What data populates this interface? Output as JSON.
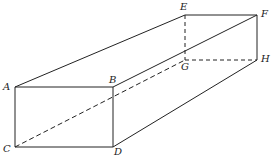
{
  "diagram": {
    "type": "rectangular prism (box) in perspective",
    "vertices": {
      "A": {
        "label": "A",
        "x": 15,
        "y": 87
      },
      "B": {
        "label": "B",
        "x": 113,
        "y": 87
      },
      "C": {
        "label": "C",
        "x": 15,
        "y": 147
      },
      "D": {
        "label": "D",
        "x": 113,
        "y": 147
      },
      "E": {
        "label": "E",
        "x": 185,
        "y": 15
      },
      "F": {
        "label": "F",
        "x": 257,
        "y": 15
      },
      "G": {
        "label": "G",
        "x": 185,
        "y": 60
      },
      "H": {
        "label": "H",
        "x": 257,
        "y": 60
      }
    },
    "solid_edges": [
      [
        "A",
        "B"
      ],
      [
        "A",
        "C"
      ],
      [
        "B",
        "D"
      ],
      [
        "C",
        "D"
      ],
      [
        "A",
        "E"
      ],
      [
        "B",
        "F"
      ],
      [
        "E",
        "F"
      ],
      [
        "F",
        "H"
      ],
      [
        "D",
        "H"
      ]
    ],
    "dashed_edges": [
      [
        "E",
        "G"
      ],
      [
        "G",
        "H"
      ],
      [
        "C",
        "G"
      ]
    ],
    "line_color": "#222222"
  }
}
